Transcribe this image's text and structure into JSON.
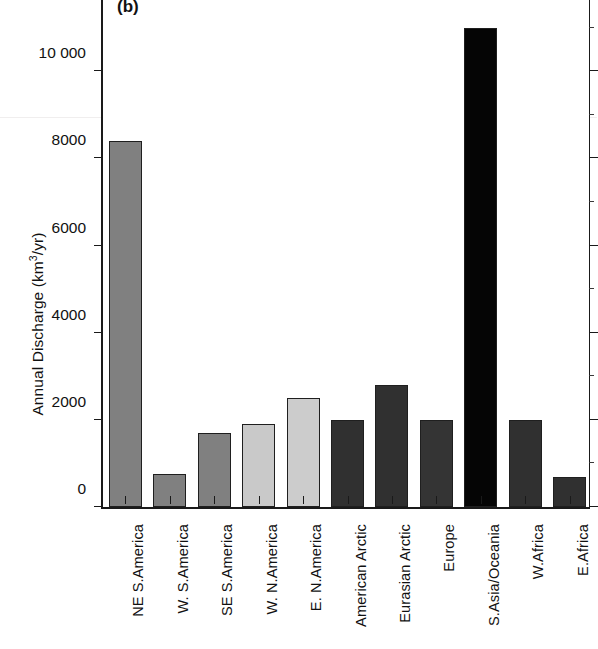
{
  "figure": {
    "panel_tag": "(b)",
    "ylabel_text": "Annual Discharge (km",
    "ylabel_exponent": "3",
    "ylabel_tail": "/yr)"
  },
  "chart_data": {
    "type": "bar",
    "title": "(b)",
    "xlabel": "",
    "ylabel": "Annual Discharge (km3/yr)",
    "ylim": [
      0,
      12000
    ],
    "yticks": [
      0,
      2000,
      4000,
      6000,
      8000,
      10000,
      12000
    ],
    "ytick_labels": [
      "0",
      "2000",
      "4000",
      "6000",
      "8000",
      "10 000",
      "12 000"
    ],
    "grid": false,
    "legend": "none",
    "categories": [
      "NE S.America",
      "W. S.America",
      "SE S.America",
      "W. N.America",
      "E. N.America",
      "American Arctic",
      "Eurasian Arctic",
      "Europe",
      "S.Asia/Oceania",
      "W.Africa",
      "E.Africa"
    ],
    "values": [
      8400,
      750,
      1700,
      1900,
      2500,
      2000,
      2800,
      2000,
      11000,
      2000,
      680
    ],
    "bar_colors": [
      "#808080",
      "#808080",
      "#808080",
      "#c9c9c9",
      "#cccccc",
      "#303030",
      "#303030",
      "#343434",
      "#050505",
      "#303030",
      "#303030"
    ]
  }
}
